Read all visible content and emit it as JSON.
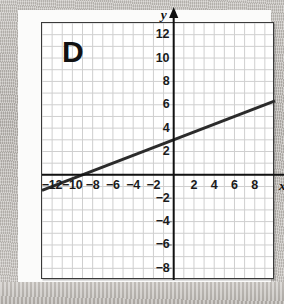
{
  "figure": {
    "choice_letter": "D",
    "x_axis_name": "x",
    "y_axis_name": "y"
  },
  "chart_data": {
    "type": "line",
    "title": "",
    "xlabel": "x",
    "ylabel": "y",
    "grid": true,
    "legend": false,
    "xlim": [
      -13,
      10
    ],
    "ylim": [
      -9,
      13
    ],
    "x_tick_labels": [
      "-12",
      "-10",
      "-8",
      "-6",
      "-4",
      "-2",
      "2",
      "4",
      "6",
      "8"
    ],
    "x_ticks": [
      -12,
      -10,
      -8,
      -6,
      -4,
      -2,
      2,
      4,
      6,
      8
    ],
    "y_tick_labels": [
      "12",
      "10",
      "8",
      "6",
      "4",
      "2",
      "-2",
      "-4",
      "-6",
      "-8"
    ],
    "y_ticks": [
      12,
      10,
      8,
      6,
      4,
      2,
      -2,
      -4,
      -6,
      -8
    ],
    "tick_step": 2,
    "grid_step": 1,
    "series": [
      {
        "name": "line",
        "equation": "y = (1/3)x + 3",
        "slope": 0.3333,
        "intercept": 3,
        "x_intercept": -9,
        "y_intercept": 3,
        "points": [
          [
            -13,
            -1.333
          ],
          [
            10,
            6.333
          ]
        ],
        "color": "#2b2b2b",
        "width": 3
      }
    ]
  },
  "colors": {
    "grid": "#cfcfcf",
    "axis": "#111111",
    "line": "#2b2b2b",
    "frame": "#3a3a3a",
    "paper": "#fbfbfa",
    "plot_background": "#ffffff",
    "text": "#1b1b1b"
  }
}
